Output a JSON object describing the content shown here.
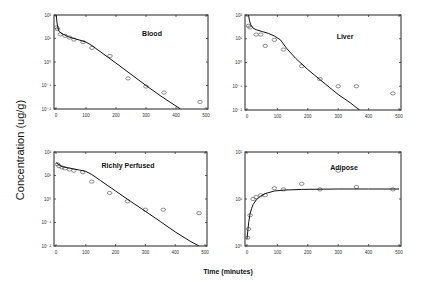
{
  "figure": {
    "ylabel": "Concentration (ug/g)",
    "xlabel": "Time (minutes)"
  },
  "chart_data": [
    {
      "type": "scatter",
      "title": "Blood",
      "xlabel": "Time (minutes)",
      "ylabel": "Concentration (ug/g)",
      "yscale": "log",
      "xlim": [
        0,
        500
      ],
      "ylim": [
        0.01,
        100
      ],
      "xticks": [
        "0",
        "100",
        "200",
        "300",
        "400",
        "500"
      ],
      "yticks": [
        "10^-2",
        "10^-1",
        "10^0",
        "10^1",
        "10^2"
      ],
      "series": [
        {
          "name": "Observed",
          "style": "open-circle",
          "x": [
            2,
            5,
            15,
            30,
            45,
            60,
            90,
            120,
            180,
            240,
            300,
            360,
            480
          ],
          "y": [
            30,
            25,
            15,
            13,
            11,
            9,
            7,
            4,
            1.8,
            0.2,
            0.09,
            0.05,
            0.02
          ]
        },
        {
          "name": "Model",
          "style": "line",
          "x": [
            1,
            3,
            6,
            10,
            20,
            40,
            60,
            80,
            100,
            120,
            150,
            200,
            250,
            300,
            350,
            415
          ],
          "y": [
            100,
            50,
            30,
            20,
            16,
            12,
            10,
            8.5,
            7,
            5,
            2.6,
            0.9,
            0.3,
            0.1,
            0.035,
            0.01
          ]
        }
      ],
      "grid": false,
      "legend": "none"
    },
    {
      "type": "scatter",
      "title": "Liver",
      "xlabel": "Time (minutes)",
      "ylabel": "Concentration (ug/g)",
      "yscale": "log",
      "xlim": [
        0,
        500
      ],
      "ylim": [
        0.01,
        100
      ],
      "xticks": [
        "0",
        "100",
        "200",
        "300",
        "400",
        "500"
      ],
      "yticks": [
        "10^-2",
        "10^-1",
        "10^0",
        "10^1",
        "10^2"
      ],
      "series": [
        {
          "name": "Observed",
          "style": "open-circle",
          "x": [
            5,
            10,
            30,
            45,
            60,
            90,
            120,
            180,
            240,
            300,
            360,
            480
          ],
          "y": [
            35,
            30,
            15,
            15,
            5,
            9,
            3.5,
            0.7,
            0.2,
            0.1,
            0.1,
            0.05
          ]
        },
        {
          "name": "Model",
          "style": "line",
          "x": [
            5,
            8,
            12,
            20,
            30,
            50,
            70,
            90,
            110,
            130,
            160,
            200,
            250,
            300,
            340,
            370
          ],
          "y": [
            100,
            60,
            40,
            28,
            24,
            20,
            17,
            13,
            9,
            4,
            1.5,
            0.5,
            0.15,
            0.045,
            0.02,
            0.01
          ]
        }
      ],
      "grid": false,
      "legend": "none"
    },
    {
      "type": "scatter",
      "title": "Richly Perfused",
      "xlabel": "Time (minutes)",
      "ylabel": "Concentration (ug/g)",
      "yscale": "log",
      "xlim": [
        0,
        500
      ],
      "ylim": [
        0.01,
        100
      ],
      "xticks": [
        "0",
        "100",
        "200",
        "300",
        "400",
        "500"
      ],
      "yticks": [
        "10^-2",
        "10^-1",
        "10^0",
        "10^1",
        "10^2"
      ],
      "series": [
        {
          "name": "Observed",
          "style": "open-circle",
          "x": [
            5,
            10,
            20,
            30,
            45,
            60,
            90,
            120,
            180,
            240,
            300,
            360,
            480
          ],
          "y": [
            30,
            25,
            22,
            20,
            18,
            16,
            14,
            5.5,
            1.8,
            0.8,
            0.35,
            0.35,
            0.25
          ]
        },
        {
          "name": "Model",
          "style": "line",
          "x": [
            0,
            20,
            50,
            80,
            100,
            120,
            150,
            200,
            250,
            300,
            350,
            400,
            450,
            480
          ],
          "y": [
            35,
            24,
            20,
            17,
            15,
            11,
            6,
            2.2,
            0.8,
            0.3,
            0.11,
            0.04,
            0.016,
            0.01
          ]
        }
      ],
      "grid": false,
      "legend": "none"
    },
    {
      "type": "scatter",
      "title": "Adipose",
      "xlabel": "Time (minutes)",
      "ylabel": "Concentration (ug/g)",
      "yscale": "log",
      "xlim": [
        0,
        500
      ],
      "ylim": [
        1,
        100
      ],
      "xticks": [
        "0",
        "100",
        "200",
        "300",
        "400",
        "500"
      ],
      "yticks": [
        "10^0",
        "10^1",
        "10^2"
      ],
      "series": [
        {
          "name": "Observed",
          "style": "open-circle",
          "x": [
            2,
            5,
            10,
            20,
            30,
            45,
            60,
            90,
            120,
            180,
            240,
            300,
            360,
            480
          ],
          "y": [
            1.5,
            2.3,
            4.5,
            10,
            11,
            12,
            12,
            17,
            16,
            21,
            16,
            40,
            18,
            16
          ]
        },
        {
          "name": "Model",
          "style": "line",
          "x": [
            0,
            3,
            6,
            10,
            15,
            20,
            30,
            45,
            60,
            90,
            120,
            180,
            240,
            300,
            400,
            500
          ],
          "y": [
            1.4,
            2.2,
            3.3,
            4.8,
            6.3,
            7.6,
            9.5,
            11.5,
            13,
            14.8,
            15.5,
            16,
            16.2,
            16.3,
            16.3,
            16.3
          ]
        }
      ],
      "grid": false,
      "legend": "none"
    }
  ],
  "panels_layout": [
    {
      "left": 54,
      "top": 15,
      "right": 208,
      "bottom": 109,
      "label_x": 152,
      "label_y": 36
    },
    {
      "left": 245,
      "top": 15,
      "right": 401,
      "bottom": 110,
      "label_x": 345,
      "label_y": 39
    },
    {
      "left": 54,
      "top": 152,
      "right": 207,
      "bottom": 246,
      "label_x": 128,
      "label_y": 168
    },
    {
      "left": 245,
      "top": 152,
      "right": 401,
      "bottom": 246,
      "label_x": 344,
      "label_y": 170
    }
  ]
}
